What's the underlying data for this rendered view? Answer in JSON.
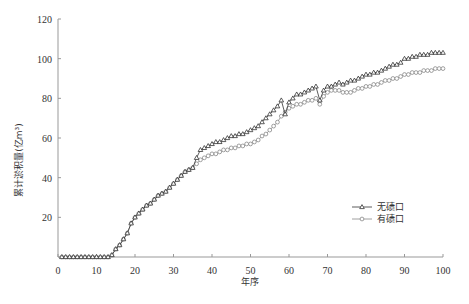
{
  "chart_data": {
    "type": "line",
    "title": "",
    "xlabel": "年序",
    "ylabel": "累计淤积量(亿m³)",
    "xlim": [
      0,
      100
    ],
    "ylim": [
      0,
      120
    ],
    "xticks": [
      0,
      10,
      20,
      30,
      40,
      50,
      60,
      70,
      80,
      90,
      100
    ],
    "yticks": [
      0,
      20,
      40,
      60,
      80,
      100,
      120
    ],
    "grid": false,
    "legend_position": "lower right",
    "x": [
      1,
      2,
      3,
      4,
      5,
      6,
      7,
      8,
      9,
      10,
      11,
      12,
      13,
      14,
      15,
      16,
      17,
      18,
      19,
      20,
      21,
      22,
      23,
      24,
      25,
      26,
      27,
      28,
      29,
      30,
      31,
      32,
      33,
      34,
      35,
      36,
      37,
      38,
      39,
      40,
      41,
      42,
      43,
      44,
      45,
      46,
      47,
      48,
      49,
      50,
      51,
      52,
      53,
      54,
      55,
      56,
      57,
      58,
      59,
      60,
      61,
      62,
      63,
      64,
      65,
      66,
      67,
      68,
      69,
      70,
      71,
      72,
      73,
      74,
      75,
      76,
      77,
      78,
      79,
      80,
      81,
      82,
      83,
      84,
      85,
      86,
      87,
      88,
      89,
      90,
      91,
      92,
      93,
      94,
      95,
      96,
      97,
      98,
      99,
      100
    ],
    "series": [
      {
        "name": "无碛口",
        "marker": "triangle",
        "values": [
          0,
          0,
          0,
          0,
          0,
          0,
          0,
          0,
          0,
          0,
          0,
          0,
          0,
          1,
          4,
          6,
          9,
          12,
          17,
          20,
          22,
          24,
          26,
          27,
          29,
          31,
          32,
          33,
          35,
          37,
          39,
          41,
          43,
          44,
          45,
          50,
          54,
          55,
          56,
          57,
          58,
          58,
          59,
          60,
          61,
          61,
          62,
          62,
          63,
          64,
          65,
          66,
          68,
          70,
          72,
          74,
          76,
          79,
          72,
          78,
          80,
          82,
          82,
          83,
          84,
          85,
          86,
          79,
          84,
          86,
          86,
          87,
          88,
          87,
          88,
          89,
          89,
          90,
          91,
          92,
          92,
          93,
          93,
          94,
          95,
          96,
          97,
          97,
          98,
          100,
          100,
          101,
          101,
          102,
          102,
          102,
          103,
          103,
          103,
          103
        ]
      },
      {
        "name": "有碛口",
        "marker": "circle",
        "values": [
          0,
          0,
          0,
          0,
          0,
          0,
          0,
          0,
          0,
          0,
          0,
          0,
          0,
          1,
          4,
          6,
          9,
          12,
          17,
          20,
          22,
          24,
          26,
          27,
          29,
          31,
          32,
          33,
          35,
          37,
          39,
          41,
          43,
          44,
          45,
          47,
          49,
          50,
          51,
          52,
          52,
          53,
          54,
          54,
          55,
          55,
          56,
          56,
          57,
          57,
          58,
          59,
          61,
          62,
          64,
          66,
          68,
          71,
          73,
          75,
          76,
          77,
          77,
          78,
          79,
          79,
          80,
          77,
          81,
          83,
          84,
          84,
          84,
          83,
          83,
          83,
          84,
          85,
          85,
          86,
          86,
          87,
          87,
          88,
          89,
          89,
          90,
          90,
          91,
          92,
          92,
          93,
          93,
          93,
          94,
          94,
          94,
          95,
          95,
          95
        ]
      }
    ]
  },
  "caption_fragment": "…综合型旅游大坝基金…期中规划碛口…"
}
